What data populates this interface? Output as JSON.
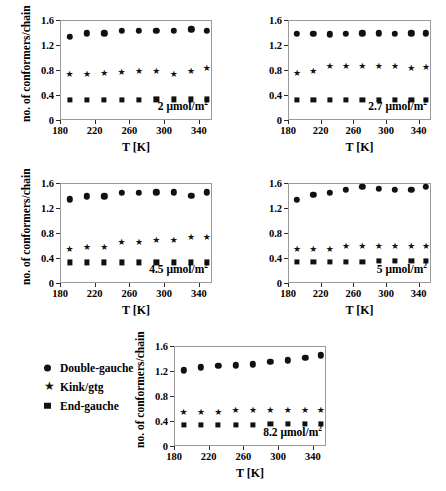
{
  "figure": {
    "background": "#ffffff",
    "marker_color": "#111111",
    "axis_color": "#2b2b2b"
  },
  "legend": {
    "position": "bottom-left",
    "items": [
      {
        "symbol": "circle",
        "glyph": "●",
        "label": "Double-gauche"
      },
      {
        "symbol": "star",
        "glyph": "★",
        "label": "Kink/gtg"
      },
      {
        "symbol": "square",
        "glyph": "■",
        "label": "End-gauche"
      }
    ]
  },
  "axes": {
    "xlabel": "T [K]",
    "ylabel": "no. of conformers/chain",
    "xlim": [
      180,
      355
    ],
    "ylim": [
      0,
      1.6
    ],
    "xticks": [
      180,
      220,
      260,
      300,
      340
    ],
    "xtick_labels": [
      "180",
      "220",
      "260",
      "300",
      "340"
    ],
    "yticks": [
      0,
      0.4,
      0.8,
      1.2,
      1.6
    ],
    "ytick_labels": [
      "0",
      "0.4",
      "0.8",
      "1.2",
      "1.6"
    ],
    "grid": false
  },
  "chart_data": [
    {
      "type": "scatter",
      "title": "2 μmol/m²",
      "panel_label_value": "2",
      "panel_label_unit": "μmol/m",
      "panel_label_sup": "2",
      "xlabel": "T [K]",
      "ylabel": "no. of conformers/chain",
      "xlim": [
        180,
        355
      ],
      "ylim": [
        0,
        1.6
      ],
      "x": [
        191,
        211,
        231,
        251,
        271,
        291,
        311,
        331,
        349
      ],
      "series": [
        {
          "name": "Double-gauche",
          "symbol": "circle",
          "values": [
            1.33,
            1.39,
            1.39,
            1.43,
            1.43,
            1.43,
            1.43,
            1.45,
            1.43
          ]
        },
        {
          "name": "Kink/gtg",
          "symbol": "star",
          "values": [
            0.74,
            0.74,
            0.76,
            0.77,
            0.79,
            0.79,
            0.74,
            0.79,
            0.83
          ]
        },
        {
          "name": "End-gauche",
          "symbol": "square",
          "values": [
            0.32,
            0.32,
            0.32,
            0.32,
            0.32,
            0.33,
            0.33,
            0.33,
            0.33
          ]
        }
      ]
    },
    {
      "type": "scatter",
      "title": "2.7 μmol/m²",
      "panel_label_value": "2.7",
      "panel_label_unit": "μmol/m",
      "panel_label_sup": "2",
      "xlabel": "T [K]",
      "ylabel": "no. of conformers/chain",
      "xlim": [
        180,
        355
      ],
      "ylim": [
        0,
        1.6
      ],
      "x": [
        191,
        211,
        231,
        251,
        271,
        291,
        311,
        331,
        349
      ],
      "series": [
        {
          "name": "Double-gauche",
          "symbol": "circle",
          "values": [
            1.38,
            1.38,
            1.37,
            1.38,
            1.39,
            1.39,
            1.38,
            1.39,
            1.39
          ]
        },
        {
          "name": "Kink/gtg",
          "symbol": "star",
          "values": [
            0.76,
            0.78,
            0.86,
            0.87,
            0.87,
            0.87,
            0.87,
            0.84,
            0.85
          ]
        },
        {
          "name": "End-gauche",
          "symbol": "square",
          "values": [
            0.32,
            0.32,
            0.32,
            0.32,
            0.32,
            0.32,
            0.32,
            0.32,
            0.32
          ]
        }
      ]
    },
    {
      "type": "scatter",
      "title": "4.5 μmol/m²",
      "panel_label_value": "4.5",
      "panel_label_unit": "μmol/m",
      "panel_label_sup": "2",
      "xlabel": "T [K]",
      "ylabel": "no. of conformers/chain",
      "xlim": [
        180,
        355
      ],
      "ylim": [
        0,
        1.6
      ],
      "x": [
        191,
        211,
        231,
        251,
        271,
        291,
        311,
        331,
        349
      ],
      "series": [
        {
          "name": "Double-gauche",
          "symbol": "circle",
          "values": [
            1.34,
            1.39,
            1.39,
            1.44,
            1.44,
            1.45,
            1.45,
            1.4,
            1.45
          ]
        },
        {
          "name": "Kink/gtg",
          "symbol": "star",
          "values": [
            0.54,
            0.58,
            0.58,
            0.65,
            0.66,
            0.69,
            0.69,
            0.74,
            0.74
          ]
        },
        {
          "name": "End-gauche",
          "symbol": "square",
          "values": [
            0.33,
            0.33,
            0.33,
            0.33,
            0.33,
            0.33,
            0.33,
            0.33,
            0.33
          ]
        }
      ]
    },
    {
      "type": "scatter",
      "title": "5 μmol/m²",
      "panel_label_value": "5",
      "panel_label_unit": "μmol/m",
      "panel_label_sup": "2",
      "xlabel": "T [K]",
      "ylabel": "no. of conformers/chain",
      "xlim": [
        180,
        355
      ],
      "ylim": [
        0,
        1.6
      ],
      "x": [
        191,
        211,
        231,
        251,
        271,
        291,
        311,
        331,
        349
      ],
      "series": [
        {
          "name": "Double-gauche",
          "symbol": "circle",
          "values": [
            1.33,
            1.41,
            1.44,
            1.49,
            1.54,
            1.51,
            1.49,
            1.49,
            1.54
          ]
        },
        {
          "name": "Kink/gtg",
          "symbol": "star",
          "values": [
            0.55,
            0.55,
            0.55,
            0.6,
            0.6,
            0.6,
            0.6,
            0.59,
            0.59
          ]
        },
        {
          "name": "End-gauche",
          "symbol": "square",
          "values": [
            0.34,
            0.34,
            0.34,
            0.34,
            0.34,
            0.35,
            0.35,
            0.35,
            0.35
          ]
        }
      ]
    },
    {
      "type": "scatter",
      "title": "8.2 μmol/m²",
      "panel_label_value": "8.2",
      "panel_label_unit": "μmol/m",
      "panel_label_sup": "2",
      "xlabel": "T [K]",
      "ylabel": "no. of conformers/chain",
      "xlim": [
        180,
        355
      ],
      "ylim": [
        0,
        1.6
      ],
      "x": [
        191,
        211,
        231,
        251,
        271,
        291,
        311,
        331,
        349
      ],
      "series": [
        {
          "name": "Double-gauche",
          "symbol": "circle",
          "values": [
            1.21,
            1.26,
            1.28,
            1.29,
            1.31,
            1.35,
            1.37,
            1.41,
            1.45
          ]
        },
        {
          "name": "Kink/gtg",
          "symbol": "star",
          "values": [
            0.54,
            0.54,
            0.54,
            0.58,
            0.58,
            0.58,
            0.58,
            0.58,
            0.58
          ]
        },
        {
          "name": "End-gauche",
          "symbol": "square",
          "values": [
            0.34,
            0.34,
            0.34,
            0.34,
            0.34,
            0.35,
            0.35,
            0.35,
            0.35
          ]
        }
      ]
    }
  ],
  "panel_geometry": [
    {
      "plot_left": 60,
      "plot_top": 20,
      "plot_width": 152,
      "plot_height": 100
    },
    {
      "plot_left": 288,
      "plot_top": 20,
      "plot_width": 143,
      "plot_height": 100
    },
    {
      "plot_left": 60,
      "plot_top": 183,
      "plot_width": 152,
      "plot_height": 100
    },
    {
      "plot_left": 288,
      "plot_top": 183,
      "plot_width": 143,
      "plot_height": 100
    },
    {
      "plot_left": 174,
      "plot_top": 346,
      "plot_width": 152,
      "plot_height": 100
    }
  ]
}
